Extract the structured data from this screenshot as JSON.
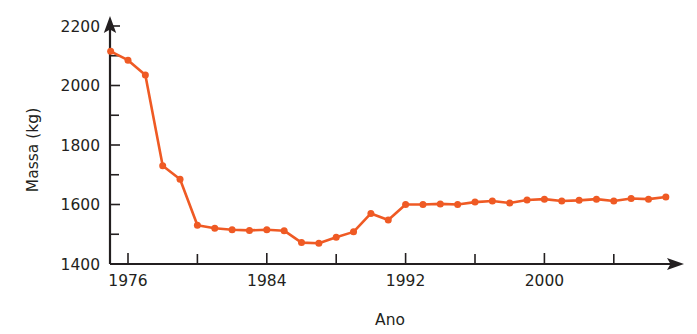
{
  "chart_data": {
    "type": "line",
    "title": "",
    "xlabel": "Ano",
    "ylabel": "Massa (kg)",
    "xlim": [
      1975,
      2008
    ],
    "ylim": [
      1400,
      2200
    ],
    "x_ticks_major": [
      1976,
      1984,
      1992,
      2000
    ],
    "x_ticks_major_labels": [
      "1976",
      "1984",
      "1992",
      "2000"
    ],
    "x_ticks_minor": [
      1980,
      1988,
      1996,
      2004
    ],
    "y_ticks_major": [
      1400,
      1600,
      1800,
      2000,
      2200
    ],
    "y_ticks_major_labels": [
      "1400",
      "1600",
      "1800",
      "2000",
      "2200"
    ],
    "y_ticks_minor": [
      1500,
      1700,
      1900,
      2100
    ],
    "grid": false,
    "legend": false,
    "marker": "circle",
    "series": [
      {
        "name": "Massa",
        "color": "#ef5a24",
        "x": [
          1975,
          1976,
          1977,
          1978,
          1979,
          1980,
          1981,
          1982,
          1983,
          1984,
          1985,
          1986,
          1987,
          1988,
          1989,
          1990,
          1991,
          1992,
          1993,
          1994,
          1995,
          1996,
          1997,
          1998,
          1999,
          2000,
          2001,
          2002,
          2003,
          2004,
          2005,
          2006,
          2007
        ],
        "values": [
          2115,
          2085,
          2035,
          1730,
          1685,
          1530,
          1520,
          1515,
          1513,
          1515,
          1512,
          1472,
          1470,
          1490,
          1508,
          1570,
          1548,
          1600,
          1600,
          1602,
          1600,
          1608,
          1612,
          1605,
          1615,
          1618,
          1612,
          1614,
          1618,
          1612,
          1620,
          1618,
          1625
        ]
      }
    ]
  },
  "axis": {
    "y_label": "Massa (kg)",
    "x_label": "Ano"
  }
}
